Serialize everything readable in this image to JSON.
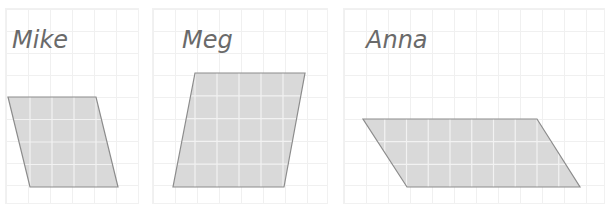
{
  "figure": {
    "panels": [
      {
        "name": "Mike",
        "label": "Mike",
        "shape": "parallelogram",
        "grid_columns": 4,
        "grid_rows": 4,
        "vertices": [
          [
            8,
            97
          ],
          [
            96,
            97
          ],
          [
            118,
            187
          ],
          [
            30,
            187
          ]
        ]
      },
      {
        "name": "Meg",
        "label": "Meg",
        "shape": "parallelogram",
        "grid_columns": 5,
        "grid_rows": 5,
        "vertices": [
          [
            195,
            73
          ],
          [
            305,
            73
          ],
          [
            284,
            187
          ],
          [
            173,
            187
          ]
        ]
      },
      {
        "name": "Anna",
        "label": "Anna",
        "shape": "parallelogram",
        "grid_columns": 8,
        "grid_rows": 3,
        "vertices": [
          [
            363,
            119
          ],
          [
            537,
            119
          ],
          [
            580,
            187
          ],
          [
            407,
            187
          ]
        ]
      }
    ],
    "colors": {
      "shape_fill": "#d9d9d9",
      "shape_stroke": "#8c8c8c",
      "inner_grid": "#f2f2f2",
      "label": "#6a6a6a"
    }
  }
}
